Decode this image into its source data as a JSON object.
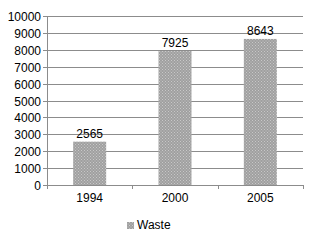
{
  "chart_data": {
    "type": "bar",
    "title": "",
    "xlabel": "",
    "ylabel": "",
    "categories": [
      "1994",
      "2000",
      "2005"
    ],
    "series": [
      {
        "name": "Waste",
        "values": [
          2565,
          7925,
          8643
        ],
        "color": "#a6a6a6"
      }
    ],
    "data_labels": [
      "2565",
      "7925",
      "8643"
    ],
    "ylim": [
      0,
      10000
    ],
    "yticks": [
      0,
      1000,
      2000,
      3000,
      4000,
      5000,
      6000,
      7000,
      8000,
      9000,
      10000
    ],
    "grid": true,
    "legend_position": "bottom"
  },
  "legend": {
    "label": "Waste"
  }
}
